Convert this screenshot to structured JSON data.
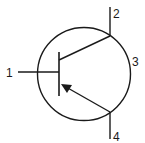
{
  "diagram": {
    "type": "transistor-schematic-symbol",
    "variant": "PNP",
    "stroke_color": "#1a1a1a",
    "background": "#ffffff",
    "terminals": [
      {
        "id": "1",
        "label": "1"
      },
      {
        "id": "2",
        "label": "2"
      },
      {
        "id": "3",
        "label": "3"
      },
      {
        "id": "4",
        "label": "4"
      }
    ]
  }
}
